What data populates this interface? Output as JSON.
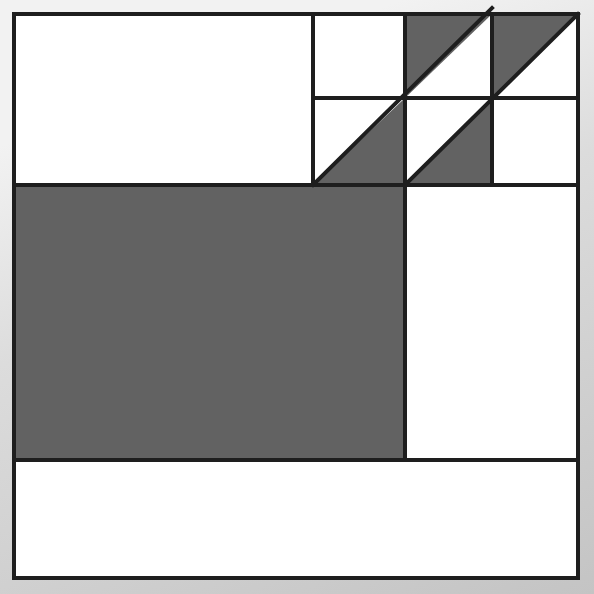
{
  "figure": {
    "type": "diagram",
    "canvas": {
      "width": 594,
      "height": 594
    },
    "colors": {
      "fill_shaded": "#626262",
      "fill_plain": "#ffffff",
      "stroke": "#1e1e1e",
      "backdrop_light": "#f2f2f2",
      "backdrop_dark": "#c4c4c4"
    },
    "stroke_width": 4,
    "outer_square": {
      "x": 14,
      "y": 14,
      "width": 564,
      "height": 564
    },
    "grid_lines": [
      {
        "name": "horizontal-upper-right",
        "x1": 313,
        "y1": 98,
        "x2": 578,
        "y2": 98
      },
      {
        "name": "horizontal-mid",
        "x1": 14,
        "y1": 185,
        "x2": 578,
        "y2": 185
      },
      {
        "name": "horizontal-lower",
        "x1": 14,
        "y1": 460,
        "x2": 578,
        "y2": 460
      },
      {
        "name": "vertical-left-of-tiles",
        "x1": 313,
        "y1": 14,
        "x2": 313,
        "y2": 185
      },
      {
        "name": "vertical-center",
        "x1": 405,
        "y1": 14,
        "x2": 405,
        "y2": 460
      },
      {
        "name": "vertical-right-of-tiles",
        "x1": 492,
        "y1": 14,
        "x2": 492,
        "y2": 185
      }
    ],
    "shaded_regions": [
      {
        "name": "large-shaded-rectangle",
        "shape": "rectangle",
        "points": "14,185 405,185 405,460 14,460"
      },
      {
        "name": "shaded-triangle-lower-left-tile",
        "shape": "triangle",
        "points": "313,185 405,185 405,98"
      },
      {
        "name": "shaded-triangle-center-lower-tile",
        "shape": "triangle",
        "points": "405,185 492,185 492,98"
      },
      {
        "name": "shaded-triangle-center-upper-tile",
        "shape": "triangle",
        "points": "405,98 405,14 492,14"
      },
      {
        "name": "shaded-triangle-upper-right-tile",
        "shape": "triangle",
        "points": "492,98 492,14 578,14"
      }
    ],
    "diagonal_band": {
      "name": "diagonal-stripe",
      "from": "313,185",
      "to": "578,14",
      "description": "staircase band of four right triangles rising to the upper right corner"
    },
    "plain_regions": [
      {
        "name": "top-left-white-rectangle",
        "points": "14,14 313,14 313,185 14,185"
      },
      {
        "name": "top-tile-white-square",
        "points": "313,14 405,14 405,98 313,98"
      },
      {
        "name": "tile-white-triangle-a",
        "points": "313,98 405,98 313,185"
      },
      {
        "name": "tile-white-triangle-b",
        "points": "405,98 492,98 405,185"
      },
      {
        "name": "tile-white-triangle-c",
        "points": "405,14 492,14 492,98"
      },
      {
        "name": "tile-white-triangle-d",
        "points": "492,14 578,14 578,98"
      },
      {
        "name": "right-white-square-upper",
        "points": "492,98 578,98 578,185 492,185"
      },
      {
        "name": "right-white-rectangle",
        "points": "405,185 578,185 578,460 405,460"
      },
      {
        "name": "bottom-white-strip",
        "points": "14,460 578,460 578,578 14,578"
      }
    ]
  }
}
